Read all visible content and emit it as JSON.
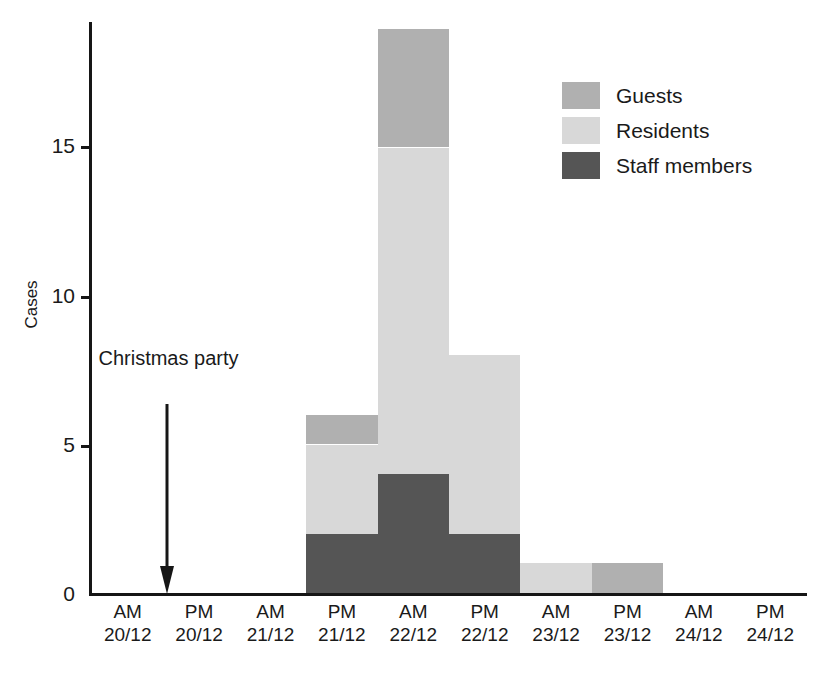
{
  "chart_data": {
    "type": "bar",
    "title": "",
    "subtitle": "",
    "xlabel": "",
    "ylabel": "Cases",
    "stacked": true,
    "grid": false,
    "legend_position": "top-right",
    "ylim": [
      0,
      19.5
    ],
    "yticks": [
      0,
      5,
      10,
      15
    ],
    "ytick_labels": [
      "0",
      "5",
      "10",
      "15"
    ],
    "categories": [
      "AM\n20/12",
      "PM\n20/12",
      "AM\n21/12",
      "PM\n21/12",
      "AM\n22/12",
      "PM\n22/12",
      "AM\n23/12",
      "PM\n23/12",
      "AM\n24/12",
      "PM\n24/12"
    ],
    "category_lines": [
      {
        "top": "AM",
        "bottom": "20/12"
      },
      {
        "top": "PM",
        "bottom": "20/12"
      },
      {
        "top": "AM",
        "bottom": "21/12"
      },
      {
        "top": "PM",
        "bottom": "21/12"
      },
      {
        "top": "AM",
        "bottom": "22/12"
      },
      {
        "top": "PM",
        "bottom": "22/12"
      },
      {
        "top": "AM",
        "bottom": "23/12"
      },
      {
        "top": "PM",
        "bottom": "23/12"
      },
      {
        "top": "AM",
        "bottom": "24/12"
      },
      {
        "top": "PM",
        "bottom": "24/12"
      }
    ],
    "series": [
      {
        "name": "Staff members",
        "color": "#555555",
        "values": [
          0,
          0,
          0,
          2,
          4,
          2,
          0,
          0,
          0,
          0
        ]
      },
      {
        "name": "Residents",
        "color": "#d8d8d8",
        "values": [
          0,
          0,
          0,
          3,
          11,
          6,
          1,
          0,
          0,
          0
        ]
      },
      {
        "name": "Guests",
        "color": "#b0b0b0",
        "values": [
          0,
          0,
          0,
          1,
          4,
          0,
          0,
          1,
          0,
          0
        ]
      }
    ],
    "totals": [
      0,
      0,
      0,
      6,
      19,
      8,
      1,
      1,
      0,
      0
    ],
    "annotations": [
      {
        "text_line1": "Christmas",
        "text_line2": "party",
        "points_to_category": "PM 20/12",
        "arrow": "down"
      }
    ]
  },
  "legend": {
    "items": [
      {
        "label": "Guests",
        "color": "#b0b0b0"
      },
      {
        "label": "Residents",
        "color": "#d8d8d8"
      },
      {
        "label": "Staff members",
        "color": "#555555"
      }
    ]
  },
  "axis": {
    "y_title": "Cases",
    "y_ticks": [
      "15",
      "10",
      "5",
      "0"
    ]
  },
  "annotation": {
    "line1": "Christmas",
    "line2": "party"
  },
  "colors": {
    "guests": "#b0b0b0",
    "residents": "#d8d8d8",
    "staff": "#555555",
    "axis": "#161616",
    "text": "#1a1a1a",
    "background": "#ffffff"
  }
}
